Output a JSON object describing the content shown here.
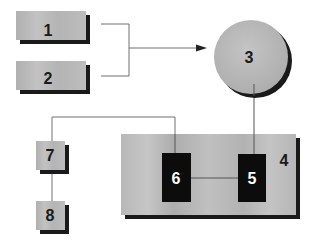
{
  "diagram": {
    "colors": {
      "box_fill": "#b4b4b4",
      "box_fill_light": "#c4c4c4",
      "shadow": "#1a1a1a",
      "dark_box": "#0c0c0c",
      "line": "#707070",
      "arrow": "#222222",
      "text_dark": "#1a1a1a",
      "text_light": "#ffffff"
    },
    "nodes": [
      {
        "id": "1",
        "label": "1",
        "shape": "rect"
      },
      {
        "id": "2",
        "label": "2",
        "shape": "rect"
      },
      {
        "id": "3",
        "label": "3",
        "shape": "circle"
      },
      {
        "id": "4",
        "label": "4",
        "shape": "container"
      },
      {
        "id": "5",
        "label": "5",
        "shape": "rect-dark"
      },
      {
        "id": "6",
        "label": "6",
        "shape": "rect-dark"
      },
      {
        "id": "7",
        "label": "7",
        "shape": "rect"
      },
      {
        "id": "8",
        "label": "8",
        "shape": "rect"
      }
    ],
    "edges": [
      {
        "from": [
          "1",
          "2"
        ],
        "to": "3",
        "type": "bracket-arrow"
      },
      {
        "from": "3",
        "to": "5",
        "type": "line"
      },
      {
        "from": "5",
        "to": "6",
        "type": "line"
      },
      {
        "from": "6",
        "to": "7",
        "type": "line"
      },
      {
        "from": "7",
        "to": "8",
        "type": "line"
      }
    ]
  }
}
